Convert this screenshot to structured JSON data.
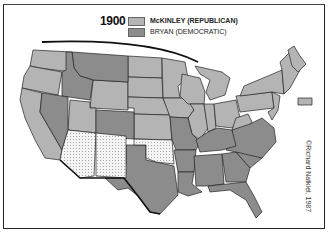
{
  "map": {
    "title_year": "1900",
    "legend": [
      {
        "label": "McKINLEY (REPUBLICAN)",
        "color": "#b4b4b4"
      },
      {
        "label": "BRYAN (DEMOCRATIC)",
        "color": "#8c8c8c"
      }
    ],
    "territories_style": "dotted (not states)",
    "credit": "©Richard Natkiel, 1987",
    "states": {
      "republican": [
        "WA",
        "OR",
        "CA",
        "WY",
        "UT",
        "ND",
        "SD",
        "NE",
        "KS",
        "MN",
        "IA",
        "WI",
        "MI",
        "IL",
        "IN",
        "OH",
        "WV",
        "PA",
        "NY",
        "VT",
        "NH",
        "ME",
        "MA",
        "RI",
        "CT",
        "NJ",
        "DE",
        "MD"
      ],
      "democratic": [
        "MT",
        "ID",
        "NV",
        "CO",
        "TX",
        "MO",
        "AR",
        "LA",
        "MS",
        "AL",
        "GA",
        "FL",
        "SC",
        "NC",
        "VA",
        "TN",
        "KY"
      ],
      "territories": [
        "AZ",
        "NM",
        "OK"
      ]
    }
  }
}
